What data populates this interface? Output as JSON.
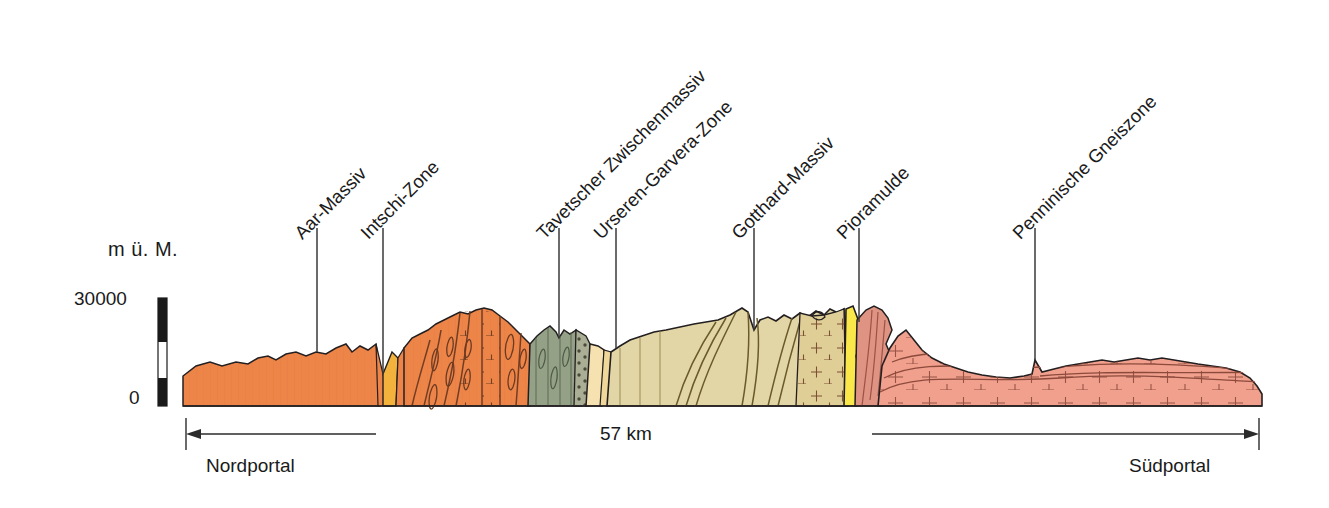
{
  "figure": {
    "kind": "geological-cross-section",
    "axis_title": "m ü. M.",
    "axis_ticks": {
      "top": "30000",
      "bottom": "0"
    },
    "span_label": "57 km",
    "portals": {
      "left": "Nordportal",
      "right": "Südportal"
    }
  },
  "unit_labels": [
    {
      "name": "Aar-Massiv",
      "x": 298,
      "y": 225,
      "leader_x": 317,
      "leader_y0": 228,
      "leader_y1": 352
    },
    {
      "name": "Intschi-Zone",
      "x": 364,
      "y": 225,
      "leader_x": 383,
      "leader_y0": 228,
      "leader_y1": 374
    },
    {
      "name": "Tavetscher Zwischenmassiv",
      "x": 540,
      "y": 225,
      "leader_x": 559,
      "leader_y0": 228,
      "leader_y1": 338
    },
    {
      "name": "Urseren-Garvera-Zone",
      "x": 597,
      "y": 225,
      "leader_x": 616,
      "leader_y0": 228,
      "leader_y1": 348
    },
    {
      "name": "Gotthard-Massiv",
      "x": 735,
      "y": 225,
      "leader_x": 754,
      "leader_y0": 228,
      "leader_y1": 330
    },
    {
      "name": "Pioramulde",
      "x": 840,
      "y": 225,
      "leader_x": 859,
      "leader_y0": 228,
      "leader_y1": 322
    },
    {
      "name": "Penninische Gneiszone",
      "x": 1016,
      "y": 225,
      "leader_x": 1035,
      "leader_y0": 228,
      "leader_y1": 360
    }
  ],
  "colors": {
    "aar_orange": "#ED8448",
    "intschi_yellow": "#F2B23C",
    "tavetscher_green": "#94A187",
    "urseren_cream": "#F6E2B0",
    "gotthard_tan": "#E3D6A6",
    "gotthard_dotted": "#E0CE97",
    "pioramulde_yellow": "#FAE84A",
    "penninic_salmon": "#F0A08C",
    "penninic_dark": "#DE9383",
    "outline": "#231f20",
    "text": "#1a1a1a",
    "scalebar_dark": "#1a1a1a",
    "scalebar_light": "#ffffff"
  },
  "geometry": {
    "baseline_y": 406,
    "left_edge_x": 183,
    "right_edge_x": 1262,
    "arrow_left": {
      "x0": 376,
      "x1": 186,
      "y": 434
    },
    "arrow_right": {
      "x0": 872,
      "x1": 1259,
      "y": 434
    },
    "scalebar": {
      "x": 158,
      "y_top": 298,
      "y_bottom": 406,
      "width": 9
    }
  }
}
